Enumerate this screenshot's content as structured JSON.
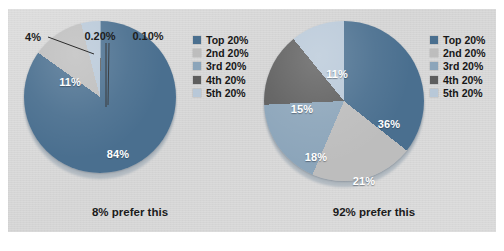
{
  "chart_data": [
    {
      "type": "pie",
      "title": "8% prefer this",
      "caption": "8% prefer this",
      "legend_position": "right",
      "categories": [
        "Top 20%",
        "2nd 20%",
        "3rd 20%",
        "4th 20%",
        "5th 20%"
      ],
      "values": [
        84,
        11,
        4,
        0.2,
        0.1
      ],
      "labels": [
        "84%",
        "11%",
        "4%",
        "0.20%",
        "0.10%"
      ],
      "colors": [
        "#4a6f8f",
        "#bdbdbd",
        "#b8c8d8",
        "#5e5e5e",
        "#8ca5ba"
      ],
      "slices": [
        {
          "name": "Top 20%",
          "value": 84,
          "label": "84%",
          "color": "#4a6f8f",
          "label_placement": "inside"
        },
        {
          "name": "2nd 20%",
          "value": 11,
          "label": "11%",
          "color": "#bdbdbd",
          "label_placement": "inside"
        },
        {
          "name": "5th 20%",
          "value": 4,
          "label": "4%",
          "color": "#b8c8d8",
          "label_placement": "outside"
        },
        {
          "name": "3rd 20%",
          "value": 0.2,
          "label": "0.20%",
          "color": "#8ca5ba",
          "label_placement": "outside"
        },
        {
          "name": "4th 20%",
          "value": 0.1,
          "label": "0.10%",
          "color": "#5e5e5e",
          "label_placement": "outside"
        }
      ]
    },
    {
      "type": "pie",
      "title": "92% prefer this",
      "caption": "92% prefer this",
      "legend_position": "right",
      "categories": [
        "Top 20%",
        "2nd 20%",
        "3rd 20%",
        "4th 20%",
        "5th 20%"
      ],
      "values": [
        36,
        21,
        18,
        15,
        11
      ],
      "labels": [
        "36%",
        "21%",
        "18%",
        "15%",
        "11%"
      ],
      "colors": [
        "#4a6f8f",
        "#bdbdbd",
        "#8ca5ba",
        "#5e5e5e",
        "#b8c8d8"
      ],
      "slices": [
        {
          "name": "Top 20%",
          "value": 36,
          "label": "36%",
          "color": "#4a6f8f",
          "label_placement": "inside"
        },
        {
          "name": "2nd 20%",
          "value": 21,
          "label": "21%",
          "color": "#bdbdbd",
          "label_placement": "inside"
        },
        {
          "name": "3rd 20%",
          "value": 18,
          "label": "18%",
          "color": "#8ca5ba",
          "label_placement": "inside"
        },
        {
          "name": "4th 20%",
          "value": 15,
          "label": "15%",
          "color": "#5e5e5e",
          "label_placement": "inside"
        },
        {
          "name": "5th 20%",
          "value": 11,
          "label": "11%",
          "color": "#b8c8d8",
          "label_placement": "inside"
        }
      ]
    }
  ],
  "left_chart": {
    "caption": "8% prefer this",
    "labels": {
      "big": "84%",
      "gray": "11%",
      "pale": "4%",
      "sliver_a": "0.20%",
      "sliver_b": "0.10%"
    },
    "legend": [
      {
        "label": "Top 20%",
        "color": "#4a6f8f"
      },
      {
        "label": "2nd 20%",
        "color": "#bdbdbd"
      },
      {
        "label": "3rd 20%",
        "color": "#8ca5ba"
      },
      {
        "label": "4th 20%",
        "color": "#5e5e5e"
      },
      {
        "label": "5th 20%",
        "color": "#b8c8d8"
      }
    ]
  },
  "right_chart": {
    "caption": "92% prefer this",
    "labels": {
      "top": "36%",
      "second": "21%",
      "third": "18%",
      "fourth": "15%",
      "fifth": "11%"
    },
    "legend": [
      {
        "label": "Top 20%",
        "color": "#4a6f8f"
      },
      {
        "label": "2nd 20%",
        "color": "#bdbdbd"
      },
      {
        "label": "3rd 20%",
        "color": "#8ca5ba"
      },
      {
        "label": "4th 20%",
        "color": "#5e5e5e"
      },
      {
        "label": "5th 20%",
        "color": "#b8c8d8"
      }
    ]
  },
  "palette": {
    "top20": "#4a6f8f",
    "second20": "#bdbdbd",
    "third20": "#8ca5ba",
    "fourth20": "#5e5e5e",
    "fifth20": "#b8c8d8",
    "panel_bg": "#d7d7d7",
    "page_bg": "#ffffff",
    "text": "#1b1b1b"
  }
}
